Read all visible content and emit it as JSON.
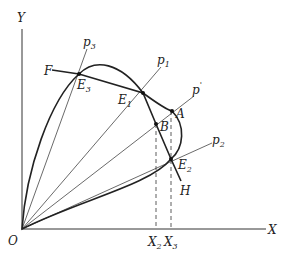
{
  "diagram": {
    "axes": {
      "origin_label": "O",
      "x_label": "X",
      "y_label": "Y"
    },
    "rays": [
      {
        "id": "p3",
        "label": "p",
        "sub": "3"
      },
      {
        "id": "p1",
        "label": "p",
        "sub": "1"
      },
      {
        "id": "p_prime",
        "label": "p",
        "sub": "'"
      },
      {
        "id": "p2",
        "label": "p",
        "sub": "2"
      }
    ],
    "points": {
      "F": "F",
      "E3": {
        "label": "E",
        "sub": "3"
      },
      "E1": {
        "label": "E",
        "sub": "1"
      },
      "A": "A",
      "B": "B",
      "E2": {
        "label": "E",
        "sub": "2"
      },
      "H": "H"
    },
    "x_ticks": [
      {
        "label": "X",
        "sub": "2"
      },
      {
        "label": "X",
        "sub": "3"
      }
    ],
    "colors": {
      "line": "#222222",
      "thin_line": "#444444",
      "background": "#ffffff"
    }
  }
}
